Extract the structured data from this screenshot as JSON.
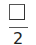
{
  "checkbox": {
    "checked": false,
    "label": "2"
  },
  "colors": {
    "border": "#333333",
    "divider": "#555555",
    "text": "#222222",
    "background": "#ffffff"
  }
}
